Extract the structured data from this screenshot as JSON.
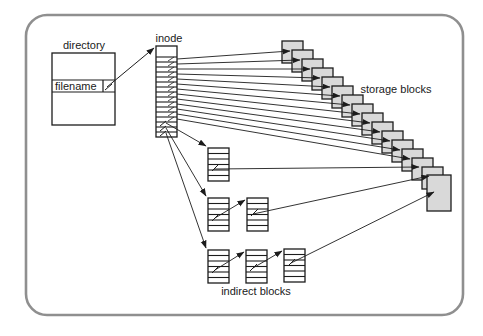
{
  "diagram": {
    "canvas": {
      "width": 483,
      "height": 336
    },
    "frame": {
      "x": 26,
      "y": 15,
      "w": 437,
      "h": 300,
      "radius": 21,
      "stroke": "#8f8f8f",
      "stroke_width": 2.6
    },
    "colors": {
      "line": "#1c1c1c",
      "block_fill": "#d9d9d9",
      "fill_white": "#ffffff",
      "text": "#1a1a1a"
    },
    "labels": {
      "directory": "directory",
      "filename": "filename",
      "inode": "inode",
      "storage_blocks": "storage blocks",
      "indirect_blocks": "indirect blocks"
    },
    "directory": {
      "box": {
        "x": 52,
        "y": 53,
        "w": 63,
        "h": 72
      },
      "row_top": 80,
      "row_bottom": 92,
      "cell_divider_x": 103,
      "label_pos": {
        "x": 84,
        "y": 49
      },
      "filename_pos": {
        "x": 55,
        "y": 90
      }
    },
    "inode": {
      "x": 156,
      "y": 46,
      "w": 21,
      "h": 91,
      "header_bottom": 57,
      "row_height": 5,
      "inner_rows": 16,
      "label_pos": {
        "x": 169,
        "y": 42
      }
    },
    "storage": {
      "first": {
        "x": 282,
        "y": 41
      },
      "step": {
        "x": 10,
        "y": 9
      },
      "count": 15,
      "size": {
        "w": 21,
        "h": 22
      },
      "large": {
        "x": 427,
        "y": 175,
        "w": 24,
        "h": 36
      },
      "label_pos": {
        "x": 396,
        "y": 93
      }
    },
    "indirect": {
      "size": {
        "w": 21,
        "h": 33
      },
      "stripes": 6,
      "blocks": [
        {
          "id": "single-indirect-block",
          "x": 208,
          "y": 148
        },
        {
          "id": "double-indirect-block-1",
          "x": 208,
          "y": 198
        },
        {
          "id": "double-indirect-block-2",
          "x": 247,
          "y": 198
        },
        {
          "id": "triple-indirect-block-1",
          "x": 208,
          "y": 250
        },
        {
          "id": "triple-indirect-block-2",
          "x": 246,
          "y": 250
        },
        {
          "id": "triple-indirect-block-3",
          "x": 284,
          "y": 249
        }
      ],
      "label_pos": {
        "x": 256,
        "y": 295
      }
    },
    "arrows": {
      "filename_to_inode": {
        "from": [
          107,
          87
        ],
        "to": [
          154,
          48
        ]
      },
      "direct": {
        "origin_x": 177,
        "first_y": 59,
        "step_y": 5,
        "count": 13,
        "tip_dx": 8,
        "tip_dy": 10
      },
      "to_indirect": [
        {
          "from": [
            166,
            123
          ],
          "to": [
            206,
            146
          ]
        },
        {
          "from": [
            166,
            128
          ],
          "to": [
            206,
            196
          ]
        },
        {
          "from": [
            166,
            133
          ],
          "to": [
            206,
            248
          ]
        }
      ],
      "chain": [
        {
          "id": "double1-to-double2",
          "from": [
            215,
            218
          ],
          "to": [
            245,
            200
          ]
        },
        {
          "id": "triple1-to-triple2",
          "from": [
            215,
            270
          ],
          "to": [
            244,
            252
          ]
        },
        {
          "id": "triple2-to-triple3",
          "from": [
            253,
            268
          ],
          "to": [
            282,
            251
          ]
        },
        {
          "id": "single-to-storage",
          "from": [
            214,
            169
          ],
          "to": [
            419,
            167
          ]
        },
        {
          "id": "double-to-storage",
          "from": [
            253,
            214
          ],
          "to": [
            429,
            176
          ]
        },
        {
          "id": "triple-to-storage",
          "from": [
            291,
            263
          ],
          "to": [
            434,
            192
          ]
        }
      ],
      "ticks": [
        {
          "from": [
            105,
            90
          ],
          "to": [
            112,
            84
          ]
        },
        {
          "from": [
            160,
            126
          ],
          "to": [
            166,
            121
          ]
        },
        {
          "from": [
            160,
            131
          ],
          "to": [
            166,
            126
          ]
        },
        {
          "from": [
            160,
            136
          ],
          "to": [
            166,
            131
          ]
        },
        {
          "from": [
            212,
            171
          ],
          "to": [
            219,
            164
          ]
        },
        {
          "from": [
            212,
            221
          ],
          "to": [
            219,
            214
          ]
        },
        {
          "from": [
            251,
            216
          ],
          "to": [
            258,
            209
          ]
        },
        {
          "from": [
            212,
            273
          ],
          "to": [
            219,
            266
          ]
        },
        {
          "from": [
            250,
            271
          ],
          "to": [
            257,
            264
          ]
        },
        {
          "from": [
            288,
            266
          ],
          "to": [
            295,
            259
          ]
        }
      ]
    }
  }
}
